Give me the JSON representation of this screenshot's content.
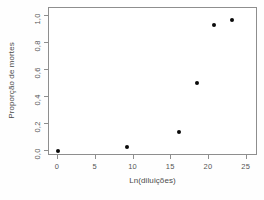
{
  "chart_data": {
    "type": "scatter",
    "title": "",
    "xlabel": "Ln(diluições)",
    "ylabel": "Proporção de mortes",
    "xlim": [
      -1.2,
      26.5
    ],
    "ylim": [
      -0.04,
      1.06
    ],
    "xticks": [
      0,
      5,
      10,
      15,
      20,
      25
    ],
    "xtick_labels": [
      "0",
      "5",
      "10",
      "15",
      "20",
      "25"
    ],
    "yticks": [
      0.0,
      0.2,
      0.4,
      0.6,
      0.8,
      1.0
    ],
    "ytick_labels": [
      "0,0",
      "0,2",
      "0,4",
      "0,6",
      "0,8",
      "1,0"
    ],
    "grid": false,
    "legend": null,
    "marker": "filled-circle",
    "marker_color": "#0a0a0a",
    "frame_color": "#8e8e8e",
    "background": "#ffffff",
    "x": [
      0.0,
      9.2,
      16.0,
      18.4,
      20.7,
      23.0
    ],
    "y": [
      0.0,
      0.03,
      0.14,
      0.5,
      0.93,
      0.97
    ],
    "points": [
      {
        "x": 0.0,
        "y": 0.0
      },
      {
        "x": 9.2,
        "y": 0.03
      },
      {
        "x": 16.0,
        "y": 0.14
      },
      {
        "x": 18.4,
        "y": 0.5
      },
      {
        "x": 20.7,
        "y": 0.93
      },
      {
        "x": 23.0,
        "y": 0.97
      }
    ]
  }
}
